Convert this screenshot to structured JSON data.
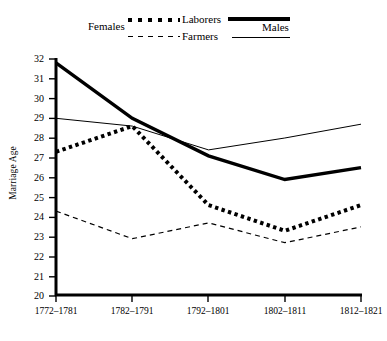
{
  "legend": {
    "left_group_label": "Females",
    "right_group_label": "Males",
    "row1_label": "Laborers",
    "row2_label": "Farmers",
    "swatch_names": {
      "females_laborers": "thick-dotted-line",
      "females_farmers": "thin-dashed-line",
      "males_laborers": "thick-solid-line",
      "males_farmers": "thin-solid-line"
    }
  },
  "axes": {
    "ylabel": "Marriage Age",
    "y_ticks": [
      "32",
      "31",
      "30",
      "29",
      "28",
      "27",
      "26",
      "25",
      "24",
      "23",
      "22",
      "21",
      "20"
    ],
    "x_ticks": [
      "1772–1781",
      "1782–1791",
      "1792–1801",
      "1802–1811",
      "1812–1821"
    ]
  },
  "colors": {
    "line": "#000000",
    "axis": "#000000",
    "background": "#ffffff"
  },
  "chart_data": {
    "type": "line",
    "title": "",
    "subtitle": "",
    "xlabel": "",
    "ylabel": "Marriage Age",
    "categories": [
      "1772–1781",
      "1782–1791",
      "1792–1801",
      "1802–1811",
      "1812–1821"
    ],
    "ylim": [
      20,
      32
    ],
    "y_ticks": [
      20,
      21,
      22,
      23,
      24,
      25,
      26,
      27,
      28,
      29,
      30,
      31,
      32
    ],
    "grid": false,
    "legend_position": "top",
    "series": [
      {
        "name": "Males Laborers",
        "style": "thick-solid",
        "values": [
          31.8,
          29.0,
          27.1,
          25.9,
          26.5
        ]
      },
      {
        "name": "Males Farmers",
        "style": "thin-solid",
        "values": [
          29.0,
          28.6,
          27.4,
          28.0,
          28.7
        ]
      },
      {
        "name": "Females Laborers",
        "style": "thick-dotted",
        "values": [
          27.3,
          28.6,
          24.6,
          23.3,
          24.6
        ]
      },
      {
        "name": "Females Farmers",
        "style": "thin-dashed",
        "values": [
          24.3,
          22.9,
          23.7,
          22.7,
          23.5
        ]
      }
    ]
  }
}
